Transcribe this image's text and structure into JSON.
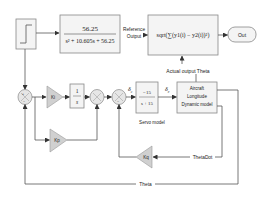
{
  "diagram": {
    "step": {
      "label": ""
    },
    "transfer_function": {
      "numerator": "56.25",
      "denominator": "s² + 10.605s + 56.25"
    },
    "reference_output": {
      "line1": "Reference",
      "line2": "Output"
    },
    "rms_block": {
      "expr": "sqrt(∑(y1(i) − y2(i))²)"
    },
    "out": {
      "label": "Out"
    },
    "actual_output": {
      "label": "Actual output Theta"
    },
    "ki": {
      "label": "Ki"
    },
    "integrator": {
      "numerator": "1",
      "denominator": "s"
    },
    "kp": {
      "label": "Kp"
    },
    "kq": {
      "label": "Kq"
    },
    "delta_c": {
      "symbol": "δ",
      "sub": "c"
    },
    "delta_e": {
      "symbol": "δ",
      "sub": "e"
    },
    "servo": {
      "numerator": "−15",
      "denominator": "s + 15",
      "caption": "Servo model"
    },
    "aircraft": {
      "line1": "Aircraft",
      "line2": "Longitude",
      "line3": "Dynamic model"
    },
    "signals": {
      "theta_dot": "ThetaDot",
      "theta": "Theta"
    },
    "sum_signs": {
      "plus": "+",
      "minus": "−"
    }
  }
}
